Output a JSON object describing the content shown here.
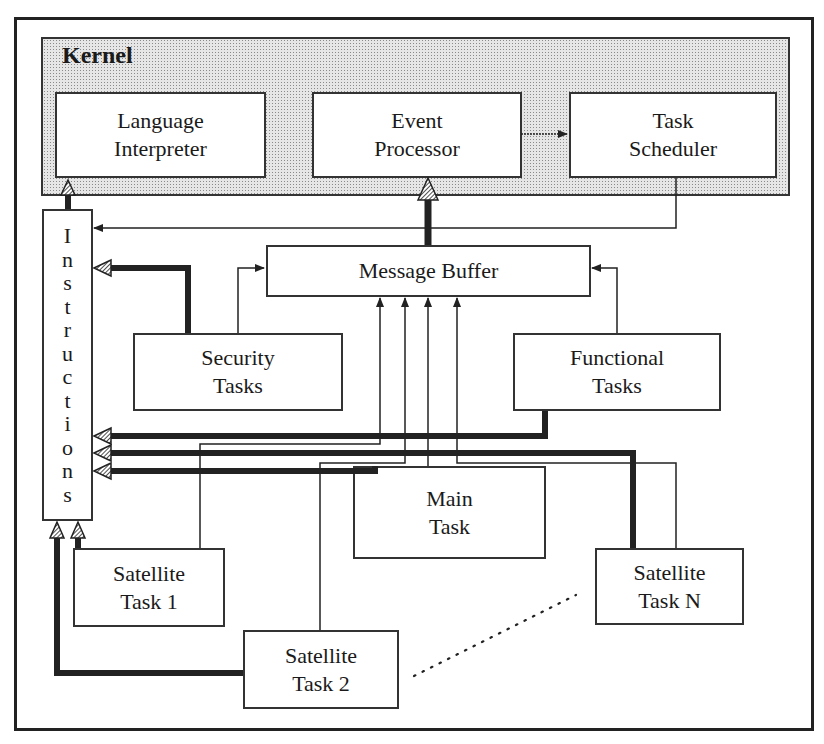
{
  "diagram": {
    "kernel": {
      "label": "Kernel",
      "components": [
        {
          "id": "language-interpreter",
          "line1": "Language",
          "line2": "Interpreter"
        },
        {
          "id": "event-processor",
          "line1": "Event",
          "line2": "Processor"
        },
        {
          "id": "task-scheduler",
          "line1": "Task",
          "line2": "Scheduler"
        }
      ]
    },
    "instructions": {
      "label": "Instructions",
      "letters": [
        "I",
        "n",
        "s",
        "t",
        "r",
        "u",
        "c",
        "t",
        "i",
        "o",
        "n",
        "s"
      ]
    },
    "message_buffer": {
      "label": "Message Buffer"
    },
    "security_tasks": {
      "line1": "Security",
      "line2": "Tasks"
    },
    "functional_tasks": {
      "line1": "Functional",
      "line2": "Tasks"
    },
    "main_task": {
      "line1": "Main",
      "line2": "Task"
    },
    "satellite_task_1": {
      "line1": "Satellite",
      "line2": "Task 1"
    },
    "satellite_task_2": {
      "line1": "Satellite",
      "line2": "Task 2"
    },
    "satellite_task_n": {
      "line1": "Satellite",
      "line2": "Task N"
    },
    "connections": [
      {
        "from": "Instructions",
        "to": "Language Interpreter",
        "style": "thick"
      },
      {
        "from": "Message Buffer",
        "to": "Event Processor",
        "style": "thick"
      },
      {
        "from": "Event Processor",
        "to": "Task Scheduler",
        "style": "thin"
      },
      {
        "from": "Task Scheduler",
        "to": "Instructions",
        "style": "thin"
      },
      {
        "from": "Security Tasks",
        "to": "Instructions",
        "style": "thick"
      },
      {
        "from": "Security Tasks",
        "to": "Message Buffer",
        "style": "thin"
      },
      {
        "from": "Functional Tasks",
        "to": "Message Buffer",
        "style": "thin"
      },
      {
        "from": "Functional Tasks",
        "to": "Instructions",
        "style": "thick"
      },
      {
        "from": "Satellite Task N",
        "to": "Instructions",
        "style": "thick"
      },
      {
        "from": "Main Task",
        "to": "Instructions",
        "style": "thick"
      },
      {
        "from": "Satellite Task 1",
        "to": "Message Buffer",
        "style": "thin"
      },
      {
        "from": "Satellite Task 2",
        "to": "Message Buffer",
        "style": "thin"
      },
      {
        "from": "Main Task",
        "to": "Message Buffer",
        "style": "thin"
      },
      {
        "from": "Satellite Task N",
        "to": "Message Buffer",
        "style": "thin"
      },
      {
        "from": "Satellite Task 1",
        "to": "Instructions",
        "style": "thick"
      },
      {
        "from": "Satellite Task 2",
        "to": "Instructions",
        "style": "thick"
      }
    ],
    "colors": {
      "line": "#222222",
      "kernel_fill": "#e6e6e6",
      "box_fill": "#ffffff"
    }
  }
}
